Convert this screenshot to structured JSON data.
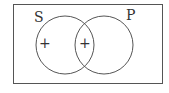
{
  "diagram": {
    "type": "venn",
    "sets": [
      {
        "name": "S",
        "label": "S",
        "region_marks": [
          "+"
        ]
      },
      {
        "name": "P",
        "label": "P",
        "region_marks": []
      }
    ],
    "intersection": {
      "sets": [
        "S",
        "P"
      ],
      "mark": "+"
    },
    "marks": {
      "s_only": "+",
      "s_and_p": "+"
    },
    "colors": {
      "stroke": "#555555",
      "text": "#333333",
      "background": "#ffffff"
    }
  }
}
